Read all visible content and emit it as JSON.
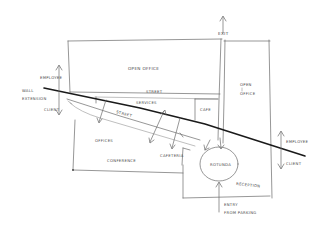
{
  "diagram": {
    "type": "hand-drawn floor plan sketch",
    "labels": {
      "exit": "EXIT",
      "open_office_main": "OPEN OFFICE",
      "open_office_right_line1": "OPEN",
      "open_office_right_line2": "OFFICE",
      "wall_extension_line1": "WALL",
      "wall_extension_line2": "EXTENSION",
      "employee_left": "EMPLOYEE",
      "client_left": "CLIENT",
      "street_upper": "STREET",
      "services": "SERVICES",
      "cafe": "CAFE",
      "street_diagonal": "STREET",
      "offices": "OFFICES",
      "cafeteria": "CAFETERIA",
      "conference": "CONFERENCE",
      "rotunda": "ROTUNDA",
      "reception": "RECEPTION",
      "employee_right": "EMPLOYEE",
      "client_right": "CLIENT",
      "entry_line1": "ENTRY",
      "entry_line2": "FROM PARKING"
    },
    "colors": {
      "background": "#ffffff",
      "ink": "#6a6a6a",
      "bold_ink": "#1a1a1a"
    }
  }
}
